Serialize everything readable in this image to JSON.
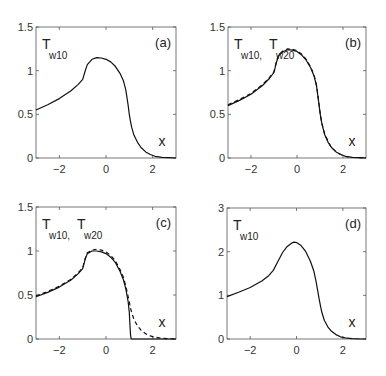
{
  "figure": {
    "width": 386,
    "height": 376
  },
  "chart_data": [
    {
      "type": "line",
      "panel": "(a)",
      "title": "",
      "xlabel": "x",
      "ylabel": "",
      "xlim": [
        -3,
        3
      ],
      "ylim": [
        0,
        1.5
      ],
      "xticks": [
        -2,
        0,
        2
      ],
      "yticks": [
        0,
        0.5,
        1,
        1.5
      ],
      "ytick_labels": [
        "0",
        "0.5",
        "1",
        "1.5"
      ],
      "grid": false,
      "legend_text": [
        {
          "main": "T",
          "sub": "w10"
        }
      ],
      "box": {
        "left": 36,
        "top": 27,
        "right": 176,
        "bottom": 158
      },
      "series": [
        {
          "name": "T_w10",
          "style": "solid",
          "x": [
            -3,
            -2.5,
            -2,
            -1.5,
            -1.2,
            -1.0,
            -0.9,
            -0.8,
            -0.6,
            -0.4,
            -0.2,
            0,
            0.2,
            0.4,
            0.6,
            0.75,
            0.85,
            0.95,
            1.0,
            1.05,
            1.1,
            1.2,
            1.35,
            1.5,
            1.7,
            1.9,
            2.1,
            2.4,
            2.7,
            3.0
          ],
          "y": [
            0.55,
            0.61,
            0.68,
            0.77,
            0.84,
            0.9,
            0.99,
            1.07,
            1.13,
            1.15,
            1.145,
            1.13,
            1.1,
            1.05,
            0.97,
            0.88,
            0.78,
            0.6,
            0.5,
            0.42,
            0.35,
            0.26,
            0.18,
            0.12,
            0.07,
            0.04,
            0.02,
            0.008,
            0.003,
            0.0
          ]
        }
      ]
    },
    {
      "type": "line",
      "panel": "(b)",
      "title": "",
      "xlabel": "x",
      "ylabel": "",
      "xlim": [
        -3,
        3
      ],
      "ylim": [
        0,
        1.5
      ],
      "xticks": [
        -2,
        0,
        2
      ],
      "yticks": [
        0,
        0.5,
        1,
        1.5
      ],
      "ytick_labels": [
        "0",
        "0.5",
        "1",
        "1.5"
      ],
      "grid": false,
      "legend_text": [
        {
          "main": "T",
          "sub": "w10",
          "suffix": ","
        },
        {
          "main": "T",
          "sub": "w20"
        }
      ],
      "box": {
        "left": 228,
        "top": 27,
        "right": 366,
        "bottom": 158
      },
      "series": [
        {
          "name": "T_w10",
          "style": "solid",
          "x": [
            -3,
            -2.5,
            -2,
            -1.5,
            -1.2,
            -1.0,
            -0.9,
            -0.8,
            -0.6,
            -0.4,
            -0.2,
            0,
            0.2,
            0.4,
            0.6,
            0.75,
            0.85,
            0.95,
            1.0,
            1.05,
            1.1,
            1.2,
            1.35,
            1.5,
            1.7,
            1.9,
            2.1,
            2.4,
            2.7,
            3.0
          ],
          "y": [
            0.6,
            0.66,
            0.73,
            0.83,
            0.91,
            0.98,
            1.09,
            1.17,
            1.22,
            1.24,
            1.235,
            1.22,
            1.18,
            1.12,
            1.03,
            0.93,
            0.82,
            0.62,
            0.52,
            0.44,
            0.37,
            0.27,
            0.18,
            0.12,
            0.07,
            0.04,
            0.02,
            0.008,
            0.003,
            0.0
          ]
        },
        {
          "name": "T_w20",
          "style": "dashed",
          "x": [
            -3,
            -2.5,
            -2,
            -1.5,
            -1.2,
            -1.0,
            -0.9,
            -0.8,
            -0.6,
            -0.4,
            -0.2,
            0,
            0.2,
            0.4,
            0.6,
            0.75,
            0.85,
            0.95,
            1.0,
            1.05,
            1.1,
            1.2,
            1.35,
            1.5,
            1.7,
            1.9,
            2.1,
            2.4,
            2.7,
            3.0
          ],
          "y": [
            0.61,
            0.67,
            0.74,
            0.84,
            0.92,
            0.99,
            1.1,
            1.18,
            1.23,
            1.25,
            1.245,
            1.23,
            1.19,
            1.13,
            1.04,
            0.94,
            0.83,
            0.63,
            0.53,
            0.45,
            0.38,
            0.28,
            0.19,
            0.12,
            0.07,
            0.04,
            0.02,
            0.008,
            0.003,
            0.0
          ]
        }
      ]
    },
    {
      "type": "line",
      "panel": "(c)",
      "title": "",
      "xlabel": "x",
      "ylabel": "",
      "xlim": [
        -3,
        3
      ],
      "ylim": [
        0,
        1.5
      ],
      "xticks": [
        -2,
        0,
        2
      ],
      "yticks": [
        0,
        0.5,
        1,
        1.5
      ],
      "ytick_labels": [
        "0",
        "0.5",
        "1",
        "1.5"
      ],
      "grid": false,
      "legend_text": [
        {
          "main": "T",
          "sub": "w10",
          "suffix": ","
        },
        {
          "main": "T",
          "sub": "w20"
        }
      ],
      "box": {
        "left": 36,
        "top": 207,
        "right": 176,
        "bottom": 339
      },
      "series": [
        {
          "name": "T_w10",
          "style": "solid",
          "x": [
            -3,
            -2.5,
            -2,
            -1.5,
            -1.2,
            -1.0,
            -0.9,
            -0.8,
            -0.6,
            -0.4,
            -0.2,
            0,
            0.2,
            0.4,
            0.6,
            0.75,
            0.85,
            0.95,
            1.0,
            1.03,
            1.05,
            1.07,
            1.1,
            1.5,
            2.0,
            3.0
          ],
          "y": [
            0.48,
            0.53,
            0.59,
            0.67,
            0.74,
            0.8,
            0.9,
            0.97,
            1.0,
            1.0,
            0.99,
            0.97,
            0.93,
            0.87,
            0.77,
            0.67,
            0.57,
            0.42,
            0.3,
            0.15,
            0.05,
            0.01,
            0.0,
            0.0,
            0.0,
            0.0
          ]
        },
        {
          "name": "T_w20",
          "style": "dashed",
          "x": [
            -3,
            -2.5,
            -2,
            -1.5,
            -1.2,
            -1.0,
            -0.9,
            -0.8,
            -0.6,
            -0.4,
            -0.2,
            0,
            0.2,
            0.4,
            0.6,
            0.75,
            0.85,
            0.95,
            1.0,
            1.05,
            1.1,
            1.2,
            1.35,
            1.5,
            1.7,
            1.9,
            2.1,
            2.4,
            2.7,
            3.0
          ],
          "y": [
            0.49,
            0.54,
            0.6,
            0.68,
            0.75,
            0.81,
            0.91,
            0.98,
            1.01,
            1.02,
            1.01,
            0.99,
            0.95,
            0.89,
            0.79,
            0.7,
            0.6,
            0.48,
            0.42,
            0.35,
            0.3,
            0.22,
            0.15,
            0.1,
            0.06,
            0.035,
            0.02,
            0.008,
            0.003,
            0.0
          ]
        }
      ]
    },
    {
      "type": "line",
      "panel": "(d)",
      "title": "",
      "xlabel": "x",
      "ylabel": "",
      "xlim": [
        -3,
        3
      ],
      "ylim": [
        0,
        3
      ],
      "xticks": [
        -2,
        0,
        2
      ],
      "yticks": [
        0,
        1,
        2,
        3
      ],
      "ytick_labels": [
        "0",
        "1",
        "2",
        "3"
      ],
      "grid": false,
      "legend_text": [
        {
          "main": "T",
          "sub": "w10"
        }
      ],
      "box": {
        "left": 227,
        "top": 208,
        "right": 366,
        "bottom": 339
      },
      "series": [
        {
          "name": "T_w10",
          "style": "solid",
          "x": [
            -3,
            -2.5,
            -2,
            -1.5,
            -1.2,
            -1.0,
            -0.8,
            -0.6,
            -0.4,
            -0.2,
            -0.1,
            0,
            0.2,
            0.4,
            0.6,
            0.75,
            0.85,
            0.95,
            1.0,
            1.05,
            1.1,
            1.2,
            1.35,
            1.5,
            1.7,
            1.9,
            2.1,
            2.4,
            2.7,
            3.0
          ],
          "y": [
            0.97,
            1.07,
            1.18,
            1.33,
            1.45,
            1.57,
            1.78,
            1.98,
            2.12,
            2.2,
            2.22,
            2.21,
            2.14,
            2.0,
            1.78,
            1.55,
            1.3,
            1.0,
            0.85,
            0.72,
            0.6,
            0.43,
            0.28,
            0.18,
            0.1,
            0.05,
            0.025,
            0.01,
            0.003,
            0.0
          ]
        }
      ]
    }
  ]
}
